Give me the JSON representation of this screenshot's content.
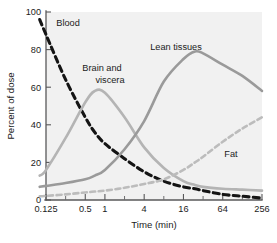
{
  "chart_data": {
    "type": "line",
    "title": "",
    "xlabel": "Time (min)",
    "ylabel": "Percent of dose",
    "xscale": "log2",
    "xlim": [
      0.125,
      256
    ],
    "ylim": [
      0,
      100
    ],
    "grid": false,
    "legend": "inline-annotations",
    "x_tick_labels": [
      "0.125",
      "0.5",
      "1",
      "4",
      "16",
      "64",
      "256"
    ],
    "x_tick_values": [
      0.125,
      0.5,
      1,
      4,
      16,
      64,
      256
    ],
    "x_minor_tick_values": [
      0.25,
      2,
      8,
      32,
      128
    ],
    "y_tick_labels": [
      "0",
      "20",
      "40",
      "60",
      "80",
      "100"
    ],
    "y_tick_values": [
      0,
      20,
      40,
      60,
      80,
      100
    ],
    "x": [
      0.1,
      0.125,
      0.25,
      0.5,
      0.7,
      1,
      2,
      4,
      8,
      16,
      24,
      32,
      64,
      128,
      256
    ],
    "series": [
      {
        "name": "Blood",
        "label": "Blood",
        "color": "#141414",
        "style": "dashed",
        "width": 3.1,
        "values": [
          96,
          88,
          64,
          44,
          36,
          30,
          22,
          15,
          10,
          7,
          6,
          5,
          3,
          2,
          1
        ]
      },
      {
        "name": "Brain and viscera",
        "label": "Brain and viscera",
        "color": "#b4b4b4",
        "style": "solid",
        "width": 2.6,
        "values": [
          13,
          16,
          33,
          52,
          58,
          57,
          44,
          28,
          17,
          10,
          8,
          7,
          6,
          5.5,
          5
        ]
      },
      {
        "name": "Lean tissues",
        "label": "Lean tissues",
        "color": "#9a9a9a",
        "style": "solid",
        "width": 2.6,
        "values": [
          7,
          7.5,
          9,
          11,
          13,
          16,
          27,
          42,
          63,
          75,
          79,
          78,
          72,
          66,
          58
        ]
      },
      {
        "name": "Fat",
        "label": "Fat",
        "color": "#bcbcbc",
        "style": "dashed",
        "width": 2.6,
        "values": [
          2,
          2.2,
          3,
          4,
          4.5,
          5,
          6.5,
          8.5,
          11,
          16,
          20,
          23,
          31,
          38,
          44
        ]
      }
    ],
    "annotations": [
      {
        "text": "Blood",
        "x_px": 68,
        "y_px": 26
      },
      {
        "text": "Brain and",
        "x_px": 102,
        "y_px": 71
      },
      {
        "text": "viscera",
        "x_px": 110,
        "y_px": 83
      },
      {
        "text": "Lean tissues",
        "x_px": 176,
        "y_px": 50
      },
      {
        "text": "Fat",
        "x_px": 231,
        "y_px": 157
      }
    ]
  }
}
